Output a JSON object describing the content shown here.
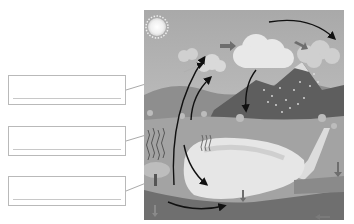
{
  "diagram": {
    "style": "grayscale illustration",
    "elements": {
      "sun": "sun-icon",
      "clouds": [
        "small cloud left",
        "large central cloud",
        "rain cloud right"
      ],
      "mountain": "snow-capped mountain with rain",
      "lake": "lake / body of water",
      "ground": "underground water layer"
    },
    "arrows": [
      {
        "name": "evaporation-arrow",
        "description": "curved arrow from lake upward to sky"
      },
      {
        "name": "transpiration-arrow",
        "description": "curved arrow from land/plants upward"
      },
      {
        "name": "condensation-arrow",
        "description": "curved arrow across top between clouds"
      },
      {
        "name": "precipitation-arrow",
        "description": "arrow from cloud down to mountain"
      },
      {
        "name": "wind-arrow-1",
        "description": "straight arrow pointing right near sun"
      },
      {
        "name": "wind-arrow-2",
        "description": "straight arrow pointing down-right to rain cloud"
      },
      {
        "name": "collection-arrow",
        "description": "curved arrow along bottom of lake"
      },
      {
        "name": "infiltration-arrows",
        "description": "downward arrows into ground"
      },
      {
        "name": "groundwater-arrow",
        "description": "arrow pointing left underground"
      }
    ]
  },
  "label_boxes": [
    {
      "id": 1,
      "text": "",
      "points_to": "evaporation"
    },
    {
      "id": 2,
      "text": "",
      "points_to": "transpiration"
    },
    {
      "id": 3,
      "text": "",
      "points_to": "collection"
    }
  ],
  "colors": {
    "box_border": "#b9b9b9",
    "answer_line": "#c8c8c8",
    "arrow": "#111111",
    "block_arrow": "#6e6e6e",
    "sky": "#bdbdbd",
    "lake": "#e6e6e6",
    "ground": "#6f6f6f"
  }
}
